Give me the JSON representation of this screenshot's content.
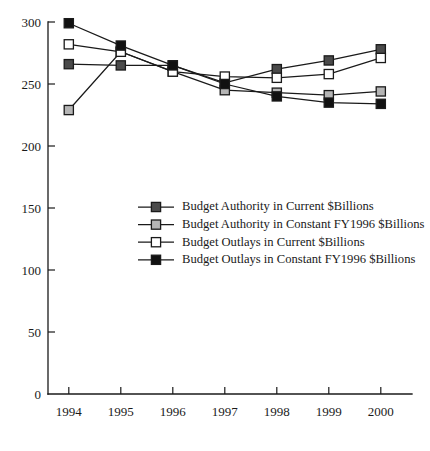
{
  "chart_data": {
    "type": "line",
    "title": "",
    "subtitle": "",
    "xlabel": "",
    "ylabel": "",
    "categories": [
      "1994",
      "1995",
      "1996",
      "1997",
      "1998",
      "1999",
      "2000"
    ],
    "x": [
      1994,
      1995,
      1996,
      1997,
      1998,
      1999,
      2000
    ],
    "xlim": [
      1993.6,
      2000.6
    ],
    "ylim": [
      0,
      300
    ],
    "yticks": [
      0,
      50,
      100,
      150,
      200,
      250,
      300
    ],
    "ytick_labels": [
      "0",
      "50",
      "100",
      "150",
      "200",
      "250",
      "300"
    ],
    "grid": false,
    "legend_position": "center-left",
    "series": [
      {
        "name": "Budget Authority in Current $Billions",
        "marker": "square-dark-gray",
        "marker_fill": "#4a4a4a",
        "values": [
          266,
          265,
          265,
          251,
          262,
          269,
          278
        ]
      },
      {
        "name": "Budget Authority in Constant FY1996 $Billions",
        "marker": "square-light-gray",
        "marker_fill": "#b5b5b5",
        "values": [
          229,
          276,
          260,
          245,
          243,
          241,
          244
        ]
      },
      {
        "name": "Budget Outlays in Current $Billions",
        "marker": "square-open-white",
        "marker_fill": "#ffffff",
        "values": [
          282,
          276,
          260,
          256,
          255,
          258,
          271
        ]
      },
      {
        "name": "Budget Outlays in Constant FY1996 $Billions",
        "marker": "square-black",
        "marker_fill": "#111111",
        "values": [
          299,
          281,
          265,
          250,
          240,
          235,
          234
        ]
      }
    ]
  },
  "colors": {
    "axis": "#1a1a1a",
    "line": "#1a1a1a",
    "background": "#ffffff",
    "marker_dark_gray": "#4a4a4a",
    "marker_light_gray": "#b5b5b5",
    "marker_white": "#ffffff",
    "marker_black": "#111111"
  }
}
